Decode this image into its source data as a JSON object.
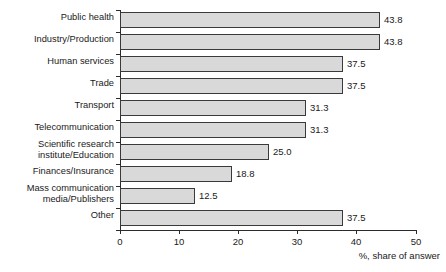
{
  "chart_data": {
    "type": "bar",
    "orientation": "horizontal",
    "title": "",
    "subtitle": "",
    "xlabel": "%, share of answer",
    "ylabel": "",
    "xlim": [
      0,
      50
    ],
    "xticks": [
      0,
      10,
      20,
      30,
      40,
      50
    ],
    "grid": false,
    "legend": null,
    "categories": [
      "Public health",
      "Industry/Production",
      "Human services",
      "Trade",
      "Transport",
      "Telecommunication",
      "Scientific research\ninstitute/Education",
      "Finances/Insurance",
      "Mass communication\nmedia/Publishers",
      "Other"
    ],
    "values": [
      43.8,
      43.8,
      37.5,
      37.5,
      31.3,
      31.3,
      25.0,
      18.8,
      12.5,
      37.5
    ],
    "value_labels": [
      "43.8",
      "43.8",
      "37.5",
      "37.5",
      "31.3",
      "31.3",
      "25.0",
      "18.8",
      "12.5",
      "37.5"
    ],
    "colors": {
      "bar_fill": "#d9d9d9",
      "bar_border": "#3a3a3a",
      "axis": "#2b2b2b",
      "text": "#1a1a1a",
      "background": "#ffffff"
    }
  }
}
